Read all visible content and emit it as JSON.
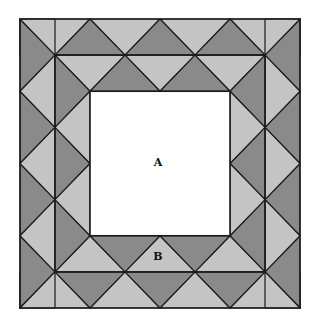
{
  "diagram": {
    "outer_box_px": {
      "left": 20,
      "top": 19,
      "right": 300,
      "bottom": 308
    },
    "grid_units": 8,
    "band_line_unit": 1,
    "inner_square_units": [
      2,
      6
    ],
    "colors": {
      "light": "#c4c4c4",
      "dark": "#8a8a8a",
      "line": "#1a1a1a",
      "inner": "#ffffff"
    }
  },
  "labels": [
    {
      "id": "A",
      "text": "A",
      "x": 158,
      "y": 162
    },
    {
      "id": "B",
      "text": "B",
      "x": 158,
      "y": 256
    }
  ]
}
